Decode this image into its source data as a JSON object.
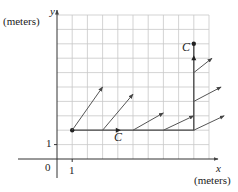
{
  "diagram": {
    "type": "vector-field-path",
    "axes": {
      "x_label": "x",
      "x_unit": "(meters)",
      "y_label": "y",
      "y_unit": "(meters)",
      "origin_label": "0",
      "x_tick_label": "1",
      "y_tick_label": "1"
    },
    "grid": {
      "cols": 10,
      "rows": 10,
      "color": "#c8c8c8"
    },
    "path_label": "C",
    "path_label_2": "C",
    "path": {
      "start": [
        1,
        2
      ],
      "corner": [
        9,
        2
      ],
      "end": [
        9,
        8
      ],
      "color": "#444444"
    },
    "vectors": [
      {
        "from": [
          1,
          2
        ],
        "to": [
          3,
          5
        ]
      },
      {
        "from": [
          3,
          2
        ],
        "to": [
          5,
          4.5
        ]
      },
      {
        "from": [
          5,
          2
        ],
        "to": [
          7,
          3.2
        ]
      },
      {
        "from": [
          7,
          2
        ],
        "to": [
          9,
          3
        ]
      },
      {
        "from": [
          9,
          2
        ],
        "to": [
          11,
          3
        ]
      },
      {
        "from": [
          9,
          4
        ],
        "to": [
          10.8,
          5
        ]
      },
      {
        "from": [
          9,
          6
        ],
        "to": [
          10.2,
          7
        ]
      }
    ],
    "colors": {
      "vector": "#555555",
      "axis": "#333333",
      "text": "#222222"
    }
  }
}
